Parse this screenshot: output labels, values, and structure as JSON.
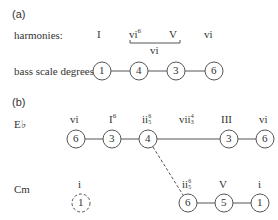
{
  "part_a": {
    "label": "(a)",
    "harmonies_label": "harmonies:",
    "bass_label": "bass scale degrees:",
    "harmonies": [
      {
        "roman": "I",
        "fig": ""
      },
      {
        "roman": "vi",
        "fig": "6"
      },
      {
        "roman": "V",
        "fig": ""
      },
      {
        "roman": "vi",
        "fig": ""
      }
    ],
    "bracket_label": "vi",
    "degrees": [
      "1",
      "4",
      "3",
      "6"
    ]
  },
  "part_b": {
    "label": "(b)",
    "key1": "E♭",
    "key2": "Cm",
    "key1_chords": [
      {
        "roman": "vi",
        "fig": ""
      },
      {
        "roman": "I",
        "fig": "6"
      },
      {
        "roman": "ii",
        "fig_top": "6",
        "fig_bot": "5"
      },
      {
        "roman": "vii",
        "fig_top": "4",
        "fig_bot": "3"
      },
      {
        "roman": "III",
        "fig": ""
      },
      {
        "roman": "vi",
        "fig": ""
      }
    ],
    "key1_degrees": [
      "6",
      "3",
      "4",
      "3",
      "6"
    ],
    "key2_chords": [
      {
        "roman": "i",
        "fig": ""
      },
      {
        "roman": "ii",
        "fig_top": "6",
        "fig_bot": "5"
      },
      {
        "roman": "V",
        "fig": ""
      },
      {
        "roman": "i",
        "fig": ""
      }
    ],
    "key2_degrees": [
      "1",
      "6",
      "5",
      "1"
    ]
  }
}
